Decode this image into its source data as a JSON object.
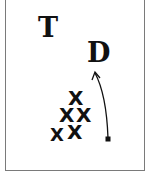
{
  "diagram": {
    "type": "play-diagram",
    "labels": {
      "t": "T",
      "d": "D"
    },
    "markers": [
      {
        "id": "x1",
        "label": "X",
        "x": 75,
        "y": 97
      },
      {
        "id": "x2",
        "label": "X",
        "x": 66,
        "y": 115
      },
      {
        "id": "x3",
        "label": "X",
        "x": 83,
        "y": 115
      },
      {
        "id": "x4",
        "label": "X",
        "x": 56,
        "y": 135
      },
      {
        "id": "x5",
        "label": "X",
        "x": 74,
        "y": 132
      }
    ],
    "arrow": {
      "start": {
        "x": 108,
        "y": 139
      },
      "end": {
        "x": 95,
        "y": 73
      },
      "start_marker": "square",
      "end_marker": "arrowhead"
    },
    "colors": {
      "ink": "#111111",
      "frame": "#7a7a7a",
      "background": "#ffffff"
    }
  }
}
